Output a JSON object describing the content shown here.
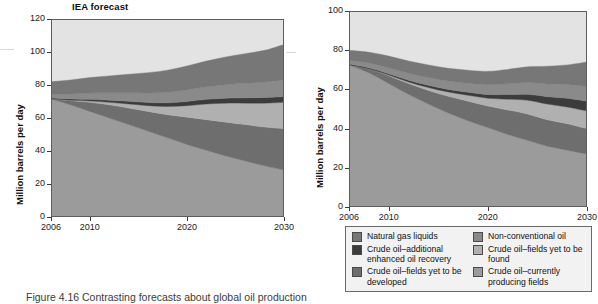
{
  "figure": {
    "caption": "Figure 4.16 Contrasting forecasts about global oil production"
  },
  "left_panel": {
    "title": "IEA forecast",
    "ylabel": "Million barrels per day",
    "yticks": [
      "0",
      "20",
      "40",
      "60",
      "80",
      "100",
      "120"
    ],
    "xticks": [
      "2006",
      "2010",
      "2020",
      "2030"
    ]
  },
  "right_panel": {
    "title": "",
    "ylabel": "Million barrels per day",
    "yticks": [
      "0",
      "20",
      "40",
      "60",
      "80",
      "100"
    ],
    "xticks": [
      "2006",
      "2010",
      "2020",
      "2030"
    ]
  },
  "legend": {
    "items": [
      {
        "label": "Natural gas liquids",
        "color": "#777777"
      },
      {
        "label": "Non-conventional oil",
        "color": "#8a8a8a"
      },
      {
        "label": "Crude oil–additional enhanced oil recovery",
        "color": "#3c3c3c"
      },
      {
        "label": "Crude oil–fields yet to be found",
        "color": "#b0b0b0"
      },
      {
        "label": "Crude oil–fields yet to be developed",
        "color": "#6e6e6e"
      },
      {
        "label": "Crude oil–currently producing fields",
        "color": "#9b9b9b"
      }
    ]
  },
  "chart_data": [
    {
      "type": "area",
      "title": "IEA forecast",
      "xlabel": "",
      "ylabel": "Million barrels per day",
      "xlim": [
        2006,
        2030
      ],
      "ylim": [
        0,
        120
      ],
      "grid": false,
      "legend_position": "below-right-panel",
      "stacked": true,
      "x": [
        2006,
        2008,
        2010,
        2012,
        2014,
        2016,
        2018,
        2020,
        2022,
        2024,
        2026,
        2028,
        2030
      ],
      "series": [
        {
          "name": "Crude oil–currently producing fields",
          "color": "#9b9b9b",
          "values": [
            71.5,
            68.0,
            64.0,
            60.0,
            56.0,
            52.0,
            48.0,
            44.0,
            40.5,
            37.0,
            34.0,
            31.0,
            28.5
          ]
        },
        {
          "name": "Crude oil–fields yet to be developed",
          "color": "#6e6e6e",
          "values": [
            0.0,
            2.5,
            5.5,
            8.0,
            10.0,
            12.0,
            14.0,
            16.5,
            18.5,
            20.5,
            22.0,
            23.5,
            25.0
          ]
        },
        {
          "name": "Crude oil–fields yet to be found",
          "color": "#b0b0b0",
          "values": [
            0.0,
            0.2,
            0.8,
            1.5,
            2.5,
            3.5,
            5.0,
            7.0,
            9.5,
            11.5,
            13.0,
            14.5,
            16.0
          ]
        },
        {
          "name": "Crude oil–additional enhanced oil recovery",
          "color": "#3c3c3c",
          "values": [
            0.6,
            0.8,
            1.0,
            1.3,
            1.6,
            1.9,
            2.2,
            2.5,
            2.8,
            3.0,
            3.2,
            3.4,
            3.5
          ]
        },
        {
          "name": "Non-conventional oil",
          "color": "#8a8a8a",
          "values": [
            2.2,
            3.0,
            3.8,
            4.5,
            5.2,
            5.8,
            6.4,
            7.0,
            7.6,
            8.2,
            8.8,
            9.4,
            10.0
          ]
        },
        {
          "name": "Natural gas liquids",
          "color": "#777777",
          "values": [
            7.7,
            8.5,
            9.4,
            10.2,
            11.2,
            12.3,
            13.4,
            14.5,
            15.6,
            16.8,
            18.0,
            19.2,
            21.5
          ]
        }
      ],
      "totals": [
        82.0,
        83.0,
        84.5,
        85.5,
        86.5,
        87.5,
        89.0,
        91.5,
        94.5,
        97.0,
        99.0,
        101.0,
        104.5
      ]
    },
    {
      "type": "area",
      "title": "",
      "xlabel": "",
      "ylabel": "Million barrels per day",
      "xlim": [
        2006,
        2030
      ],
      "ylim": [
        0,
        100
      ],
      "grid": false,
      "legend_position": "below",
      "stacked": true,
      "x": [
        2006,
        2008,
        2010,
        2012,
        2014,
        2016,
        2018,
        2020,
        2022,
        2024,
        2026,
        2028,
        2030
      ],
      "series": [
        {
          "name": "Crude oil–currently producing fields",
          "color": "#9b9b9b",
          "values": [
            72.5,
            68.5,
            63.0,
            57.5,
            52.5,
            48.0,
            44.0,
            40.5,
            37.0,
            34.0,
            31.0,
            29.0,
            27.0
          ]
        },
        {
          "name": "Crude oil–fields yet to be developed",
          "color": "#6e6e6e",
          "values": [
            0.0,
            2.0,
            4.0,
            5.5,
            7.0,
            8.5,
            10.0,
            11.0,
            12.5,
            13.5,
            13.5,
            13.5,
            13.0
          ]
        },
        {
          "name": "Crude oil–fields yet to be found",
          "color": "#b0b0b0",
          "values": [
            0.0,
            0.0,
            0.3,
            0.8,
            1.5,
            2.2,
            3.0,
            4.0,
            5.5,
            7.0,
            8.0,
            8.5,
            9.0
          ]
        },
        {
          "name": "Crude oil–additional enhanced oil recovery",
          "color": "#3c3c3c",
          "values": [
            0.4,
            0.5,
            0.7,
            0.9,
            1.1,
            1.3,
            1.6,
            1.9,
            2.4,
            3.0,
            3.8,
            4.5,
            5.0
          ]
        },
        {
          "name": "Non-conventional oil",
          "color": "#8a8a8a",
          "values": [
            2.0,
            2.5,
            3.0,
            3.5,
            4.0,
            4.3,
            4.6,
            5.0,
            5.5,
            6.0,
            6.5,
            7.0,
            7.5
          ]
        },
        {
          "name": "Natural gas liquids",
          "color": "#777777",
          "values": [
            5.1,
            5.5,
            6.0,
            6.3,
            6.4,
            6.5,
            6.6,
            6.8,
            7.3,
            8.0,
            9.0,
            10.0,
            12.5
          ]
        }
      ],
      "totals": [
        80.0,
        79.0,
        77.0,
        74.5,
        72.5,
        70.8,
        69.8,
        69.2,
        70.2,
        71.5,
        71.8,
        72.5,
        74.0
      ]
    }
  ]
}
